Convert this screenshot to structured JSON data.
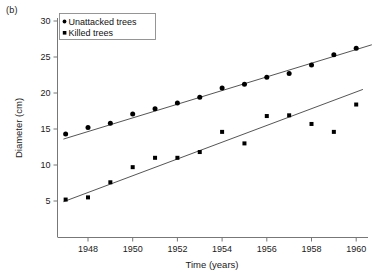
{
  "figure": {
    "panel_label": "(b)"
  },
  "chart_data": {
    "type": "scatter",
    "title": "",
    "xlabel": "Time (years)",
    "ylabel": "Diameter (cm)",
    "xlim": [
      1946.5,
      1961.0
    ],
    "ylim": [
      0,
      30
    ],
    "grid": false,
    "legend_position": "top-left",
    "xticks": [
      1948,
      1950,
      1952,
      1954,
      1956,
      1958,
      1960
    ],
    "xtick_labels": [
      "1948",
      "1950",
      "1952",
      "1954",
      "1956",
      "1958",
      "1960"
    ],
    "yticks": [
      5,
      10,
      15,
      20,
      25,
      30
    ],
    "ytick_labels": [
      "5",
      "10",
      "15",
      "20",
      "25",
      "30"
    ],
    "series": [
      {
        "name": "Unattacked  trees",
        "marker": "circle",
        "color": "#000000",
        "x": [
          1947,
          1948,
          1949,
          1950,
          1951,
          1952,
          1953,
          1954,
          1955,
          1956,
          1957,
          1958,
          1959,
          1960
        ],
        "values": [
          14.3,
          15.2,
          15.8,
          17.1,
          17.8,
          18.6,
          19.4,
          20.7,
          21.2,
          22.2,
          22.7,
          23.9,
          25.3,
          26.2
        ],
        "trend_line": {
          "x": [
            1946.9,
            1960.7
          ],
          "y": [
            13.6,
            26.7
          ]
        }
      },
      {
        "name": "Killed  trees",
        "marker": "square",
        "color": "#000000",
        "x": [
          1947,
          1948,
          1949,
          1950,
          1951,
          1952,
          1953,
          1954,
          1955,
          1956,
          1957,
          1958,
          1959,
          1960
        ],
        "values": [
          5.2,
          5.5,
          7.6,
          9.7,
          11.0,
          11.0,
          11.8,
          14.6,
          13.0,
          16.8,
          16.9,
          15.7,
          14.6,
          18.4
        ],
        "trend_line": {
          "x": [
            1946.9,
            1960.3
          ],
          "y": [
            4.9,
            20.5
          ]
        }
      }
    ]
  }
}
